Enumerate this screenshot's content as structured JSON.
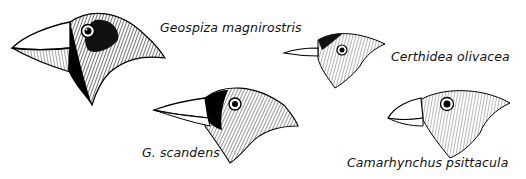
{
  "figure": {
    "birds": [
      {
        "id": "geospiza-magnirostris",
        "label": "Geospiza magnirostris"
      },
      {
        "id": "certhidea-olivacea",
        "label": "Certhidea olivacea"
      },
      {
        "id": "g-scandens",
        "label": "G. scandens"
      },
      {
        "id": "camarhynchus-psittacula",
        "label": "Camarhynchus psittacula"
      }
    ]
  }
}
